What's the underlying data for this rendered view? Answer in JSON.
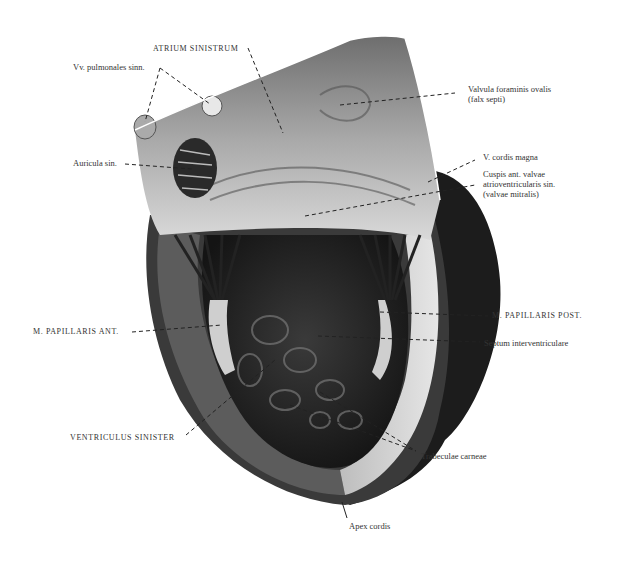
{
  "figure": {
    "colors": {
      "background": "#ffffff",
      "tissue_light": "#d8d8d8",
      "tissue_mid": "#9a9a9a",
      "tissue_dark": "#2b2b2b",
      "epicardium": "#1a1a1a",
      "leader": "#222222"
    }
  },
  "labels": {
    "atrium_sinistrum": "ATRIUM SINISTRUM",
    "vv_pulmonales": "Vv. pulmonales sinn.",
    "auricula_sin": "Auricula sin.",
    "valvula_foraminis": "Valvula foraminis ovalis\n(falx septi)",
    "v_cordis_magna": "V. cordis magna",
    "cuspis_ant": "Cuspis ant. valvae\natrioventricularis sin.\n(valvae mitralis)",
    "m_papillaris_ant": "M. PAPILLARIS ANT.",
    "m_papillaris_post": "M. PAPILLARIS POST.",
    "septum": "Septum interventriculare",
    "ventriculus_sinister": "VENTRICULUS SINISTER",
    "trabeculae": "Trabeculae carneae",
    "apex": "Apex cordis"
  }
}
